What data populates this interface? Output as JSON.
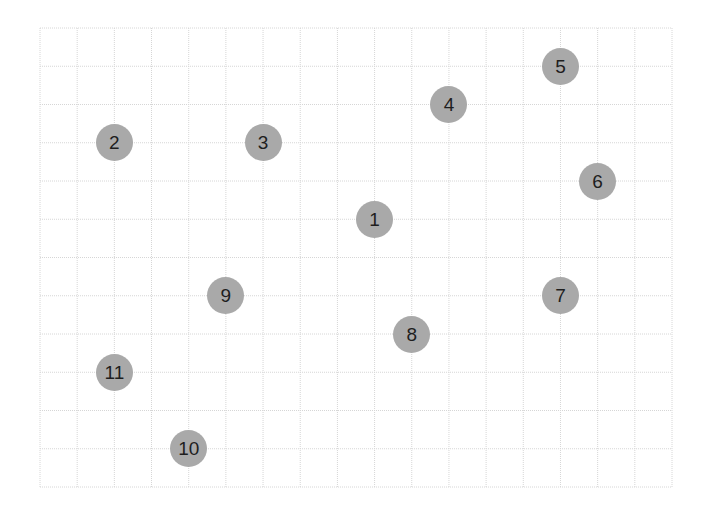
{
  "grid": {
    "left": 40,
    "top": 28,
    "right": 672,
    "bottom": 487,
    "columns": 17,
    "rows": 12,
    "line_color": "#d6d6d6",
    "background": "#ffffff"
  },
  "node_style": {
    "fill": "#a9a9a9",
    "text_color": "#1e1e1e",
    "diameter": 37
  },
  "nodes": [
    {
      "label": "1",
      "col": 9,
      "row": 5
    },
    {
      "label": "2",
      "col": 2,
      "row": 3
    },
    {
      "label": "3",
      "col": 6,
      "row": 3
    },
    {
      "label": "4",
      "col": 11,
      "row": 2
    },
    {
      "label": "5",
      "col": 14,
      "row": 1
    },
    {
      "label": "6",
      "col": 15,
      "row": 4
    },
    {
      "label": "7",
      "col": 14,
      "row": 7
    },
    {
      "label": "8",
      "col": 10,
      "row": 8
    },
    {
      "label": "9",
      "col": 5,
      "row": 7
    },
    {
      "label": "10",
      "col": 4,
      "row": 11
    },
    {
      "label": "11",
      "col": 2,
      "row": 9
    }
  ]
}
